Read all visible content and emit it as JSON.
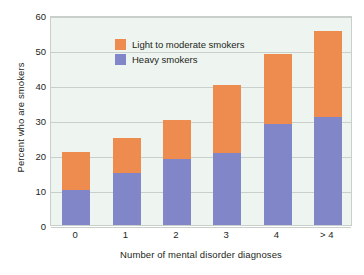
{
  "chart_data": {
    "type": "bar",
    "title": "",
    "subtitle": "",
    "stacked": true,
    "xlabel": "Number of mental disorder diagnoses",
    "ylabel": "Percent who are smokers",
    "categories": [
      "0",
      "1",
      "2",
      "3",
      "4",
      "> 4"
    ],
    "series": [
      {
        "name": "Heavy smokers",
        "color": "#8186c8",
        "values": [
          10,
          15,
          19,
          20.5,
          29,
          31
        ]
      },
      {
        "name": "Light to moderate smokers",
        "color": "#ee8b4f",
        "values": [
          11,
          10,
          11,
          19.5,
          20,
          24.5
        ]
      }
    ],
    "stack_order": [
      "Heavy smokers",
      "Light to moderate smokers"
    ],
    "totals": [
      21,
      25,
      30,
      40,
      49,
      55.5
    ],
    "ylim": [
      0,
      60
    ],
    "ytick_labels": [
      "0",
      "10",
      "20",
      "30",
      "40",
      "50",
      "60"
    ],
    "ytick_values": [
      0,
      10,
      20,
      30,
      40,
      50,
      60
    ],
    "grid": true,
    "grid_axis": "y",
    "legend_position": "top-left inside plot"
  },
  "legend": {
    "entries": [
      {
        "label": "Light to moderate smokers",
        "color": "#ee8b4f"
      },
      {
        "label": "Heavy smokers",
        "color": "#8186c8"
      }
    ]
  },
  "axes": {
    "y_title": "Percent who are smokers",
    "x_title": "Number of mental disorder diagnoses"
  },
  "colors": {
    "plot_background": "#eef5f0",
    "gridline": "#c9cfcb",
    "heavy_smokers": "#8186c8",
    "light_moderate_smokers": "#ee8b4f",
    "text": "#231f20",
    "page_background": "#ffffff"
  }
}
